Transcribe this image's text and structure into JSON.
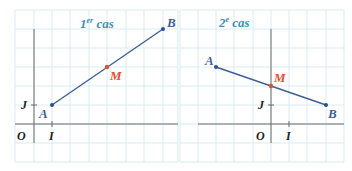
{
  "colors": {
    "grid": "#cfe8ee",
    "axis": "#6b6b6b",
    "segment": "#3b5f9a",
    "point": "#2b4f8c",
    "midpoint": "#e0502a",
    "title": "#3b8fc0",
    "axis_label": "#222222"
  },
  "panels": [
    {
      "title_main": "1",
      "title_sup": "er",
      "title_rest": " cas",
      "labels": {
        "O": "O",
        "I": "I",
        "J": "J",
        "A": "A",
        "B": "B",
        "M": "M"
      }
    },
    {
      "title_main": "2",
      "title_sup": "e",
      "title_rest": " cas",
      "labels": {
        "O": "O",
        "I": "I",
        "J": "J",
        "A": "A",
        "B": "B",
        "M": "M"
      }
    }
  ]
}
